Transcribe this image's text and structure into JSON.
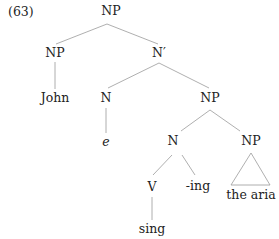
{
  "example_number": "(63)",
  "tree": {
    "nodes": {
      "root": {
        "label": "NP"
      },
      "np_john": {
        "label": "NP"
      },
      "nbar": {
        "label": "N′"
      },
      "john": {
        "label": "John"
      },
      "n_e": {
        "label": "N"
      },
      "e": {
        "label": "e"
      },
      "np_inner": {
        "label": "NP"
      },
      "n_inner": {
        "label": "N"
      },
      "np_aria": {
        "label": "NP"
      },
      "v": {
        "label": "V"
      },
      "ing": {
        "label": "-ing"
      },
      "the_aria": {
        "label": "the aria"
      },
      "sing": {
        "label": "sing"
      }
    },
    "edges": [
      [
        "root",
        "np_john"
      ],
      [
        "root",
        "nbar"
      ],
      [
        "np_john",
        "john"
      ],
      [
        "nbar",
        "n_e"
      ],
      [
        "nbar",
        "np_inner"
      ],
      [
        "n_e",
        "e"
      ],
      [
        "np_inner",
        "n_inner"
      ],
      [
        "np_inner",
        "np_aria"
      ],
      [
        "n_inner",
        "v"
      ],
      [
        "n_inner",
        "ing"
      ],
      [
        "v",
        "sing"
      ],
      [
        "np_aria",
        "the_aria",
        "triangle"
      ]
    ]
  }
}
